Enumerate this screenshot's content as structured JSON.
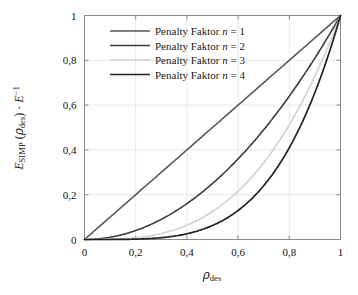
{
  "chart_data": {
    "type": "line",
    "title": "",
    "xlabel": "ρdes",
    "ylabel": "ESIMP (ρdes) · E−1",
    "xlim": [
      0,
      1
    ],
    "ylim": [
      0,
      1
    ],
    "grid": true,
    "legend_position": "top-center-inside",
    "x_ticks": [
      "0",
      "0,2",
      "0,4",
      "0,6",
      "0,8",
      "1"
    ],
    "x_tick_values": [
      0,
      0.2,
      0.4,
      0.6,
      0.8,
      1
    ],
    "y_ticks": [
      "0",
      "0,2",
      "0,4",
      "0,6",
      "0,8",
      "1"
    ],
    "y_tick_values": [
      0,
      0.2,
      0.4,
      0.6,
      0.8,
      1
    ],
    "x": [
      0,
      0.05,
      0.1,
      0.15,
      0.2,
      0.25,
      0.3,
      0.35,
      0.4,
      0.45,
      0.5,
      0.55,
      0.6,
      0.65,
      0.7,
      0.75,
      0.8,
      0.85,
      0.9,
      0.95,
      1
    ],
    "series": [
      {
        "name": "Penalty Faktor n = 1",
        "exponent": 1,
        "color": "#595959",
        "width": 1.6,
        "values": [
          0,
          0.05,
          0.1,
          0.15,
          0.2,
          0.25,
          0.3,
          0.35,
          0.4,
          0.45,
          0.5,
          0.55,
          0.6,
          0.65,
          0.7,
          0.75,
          0.8,
          0.85,
          0.9,
          0.95,
          1
        ]
      },
      {
        "name": "Penalty Faktor n = 2",
        "exponent": 2,
        "color": "#3d3d3d",
        "width": 1.6,
        "values": [
          0,
          0.0025,
          0.01,
          0.0225,
          0.04,
          0.0625,
          0.09,
          0.1225,
          0.16,
          0.2025,
          0.25,
          0.3025,
          0.36,
          0.4225,
          0.49,
          0.5625,
          0.64,
          0.7225,
          0.81,
          0.9025,
          1
        ]
      },
      {
        "name": "Penalty Faktor n = 3",
        "exponent": 3,
        "color": "#d2d2d2",
        "width": 1.6,
        "values": [
          0,
          0.000125,
          0.001,
          0.003375,
          0.008,
          0.015625,
          0.027,
          0.042875,
          0.064,
          0.091125,
          0.125,
          0.166375,
          0.216,
          0.274625,
          0.343,
          0.421875,
          0.512,
          0.614125,
          0.729,
          0.857375,
          1
        ]
      },
      {
        "name": "Penalty Faktor n = 4",
        "exponent": 4,
        "color": "#232323",
        "width": 1.7,
        "values": [
          0,
          6.25e-06,
          0.0001,
          0.00050625,
          0.0016,
          0.00390625,
          0.0081,
          0.01500625,
          0.0256,
          0.04100625,
          0.0625,
          0.09150625,
          0.1296,
          0.17850625,
          0.2401,
          0.31640625,
          0.4096,
          0.52200625,
          0.6561,
          0.81450625,
          1
        ]
      }
    ],
    "axis_color": "#8a8a8a",
    "grid_color": "#e8e8e8",
    "background": "#ffffff"
  },
  "legend": {
    "entries": [
      {
        "label_prefix": "Penalty Faktor ",
        "var": "n",
        "eq": " = ",
        "value": "1"
      },
      {
        "label_prefix": "Penalty Faktor ",
        "var": "n",
        "eq": " = ",
        "value": "2"
      },
      {
        "label_prefix": "Penalty Faktor ",
        "var": "n",
        "eq": " = ",
        "value": "3"
      },
      {
        "label_prefix": "Penalty Faktor ",
        "var": "n",
        "eq": " = ",
        "value": "4"
      }
    ]
  },
  "axis_titles": {
    "x_base": "ρ",
    "x_sub": "des",
    "y_e": "E",
    "y_e_sub": "SIMP",
    "y_open": " (",
    "y_rho": "ρ",
    "y_rho_sub": "des",
    "y_close": ") · ",
    "y_e2": "E",
    "y_e2_sup": "−1"
  }
}
